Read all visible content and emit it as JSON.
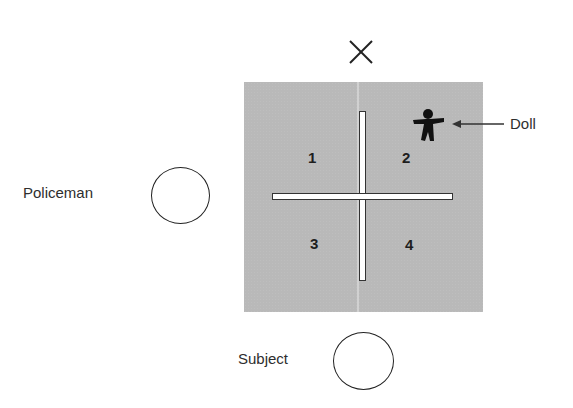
{
  "diagram": {
    "type": "hiding-experiment-layout",
    "marker": {
      "symbol": "×",
      "icon": "x-mark-icon"
    },
    "board": {
      "color": "#b9b9b9",
      "wall_color": "#ffffff",
      "quadrants": [
        {
          "label": "1"
        },
        {
          "label": "2"
        },
        {
          "label": "3"
        },
        {
          "label": "4"
        }
      ]
    },
    "doll": {
      "label": "Doll",
      "icon": "doll-figure-icon"
    },
    "policeman": {
      "label": "Policeman",
      "icon": "circle-icon"
    },
    "subject": {
      "label": "Subject",
      "icon": "circle-icon"
    }
  }
}
